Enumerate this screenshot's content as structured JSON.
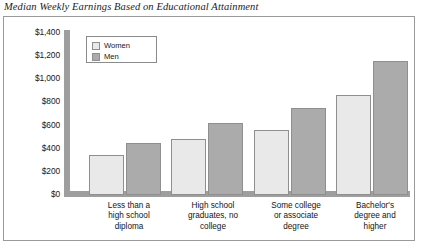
{
  "figure": {
    "title": "Median Weekly Earnings Based on Educational Attainment"
  },
  "legend": {
    "items": [
      {
        "label": "Women",
        "swatch": "light-gray-swatch",
        "color": "#e9e9e9"
      },
      {
        "label": "Men",
        "swatch": "medium-gray-swatch",
        "color": "#ababab"
      }
    ]
  },
  "axis": {
    "y_ticks": [
      "$1,400",
      "$1,200",
      "$1,000",
      "$800",
      "$600",
      "$400",
      "$200",
      "$0"
    ],
    "x_categories": [
      "Less than a\nhigh school\ndiploma",
      "High school\ngraduates, no\ncollege",
      "Some college\nor associate\ndegree",
      "Bachelor's\ndegree and\nhigher"
    ]
  },
  "x_labels": {
    "g1_line1": "Less than a",
    "g1_line2": "high school",
    "g1_line3": "diploma",
    "g2_line1": "High school",
    "g2_line2": "graduates, no",
    "g2_line3": "college",
    "g3_line1": "Some college",
    "g3_line2": "or associate",
    "g3_line3": "degree",
    "g4_line1": "Bachelor's",
    "g4_line2": "degree and",
    "g4_line3": "higher"
  },
  "chart_data": {
    "type": "bar",
    "title": "Median Weekly Earnings Based on Educational Attainment",
    "xlabel": "",
    "ylabel": "",
    "ylim": [
      0,
      1400
    ],
    "ytick_step": 200,
    "grid": false,
    "legend_position": "upper-left-inside",
    "categories": [
      "Less than a high school diploma",
      "High school graduates, no college",
      "Some college or associate degree",
      "Bachelor's degree and higher"
    ],
    "series": [
      {
        "name": "Women",
        "color": "#e9e9e9",
        "values": [
          340,
          480,
          560,
          860
        ]
      },
      {
        "name": "Men",
        "color": "#ababab",
        "values": [
          450,
          620,
          750,
          1150
        ]
      }
    ]
  }
}
